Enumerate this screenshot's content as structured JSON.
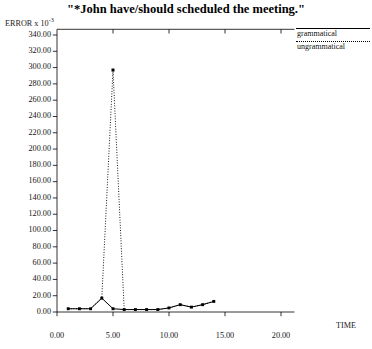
{
  "chart_data": {
    "type": "line",
    "title": "\"*John have/should scheduled the meeting.\"",
    "ylabel": "ERROR x 10",
    "ylabel_exponent": "-3",
    "xlabel": "TIME",
    "xlim": [
      0,
      21.2
    ],
    "ylim": [
      0,
      347
    ],
    "grid": false,
    "legend_position": "top-right",
    "yticks": [
      0,
      20,
      40,
      60,
      80,
      100,
      120,
      140,
      160,
      180,
      200,
      220,
      240,
      260,
      280,
      300,
      320,
      340
    ],
    "ytick_labels": [
      "0.00",
      "20.00",
      "40.00",
      "60.00",
      "80.00",
      "100.00",
      "120.00",
      "140.00",
      "160.00",
      "180.00",
      "200.00",
      "220.00",
      "240.00",
      "260.00",
      "280.00",
      "300.00",
      "320.00",
      "340.00"
    ],
    "xticks": [
      0,
      5,
      10,
      15,
      20
    ],
    "xtick_labels": [
      "0.00",
      "5.00",
      "10.00",
      "15.00",
      "20.00"
    ],
    "series": [
      {
        "name": "grammatical",
        "style": "solid",
        "marker": "square",
        "x": [
          1,
          2,
          3,
          4,
          5,
          6,
          7,
          8,
          9,
          10,
          11,
          12,
          13,
          14
        ],
        "values": [
          4,
          4,
          4,
          17,
          4,
          3,
          3,
          3,
          3,
          5,
          9,
          6,
          9,
          13
        ]
      },
      {
        "name": "ungrammatical",
        "style": "dotted",
        "marker": "square",
        "x": [
          1,
          2,
          3,
          4,
          5,
          6,
          7,
          8,
          9,
          10,
          11,
          12,
          13,
          14
        ],
        "values": [
          4,
          4,
          4,
          17,
          297,
          3,
          3,
          3,
          3,
          5,
          9,
          6,
          9,
          13
        ]
      }
    ]
  },
  "legend": {
    "items": [
      {
        "label": "grammatical",
        "style": "solid"
      },
      {
        "label": "ungrammatical",
        "style": "dotted"
      }
    ]
  }
}
